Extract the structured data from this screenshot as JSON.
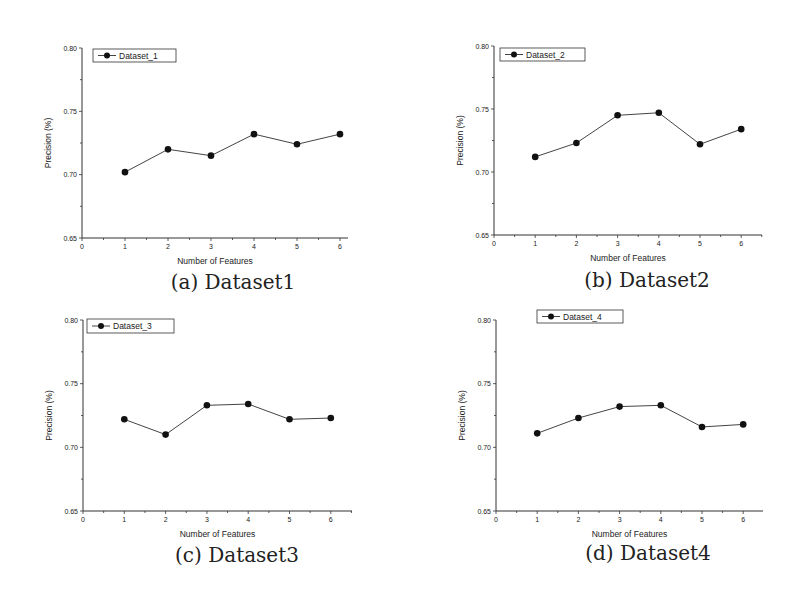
{
  "chart_data": [
    {
      "type": "line",
      "title": "Dataset_1",
      "caption": "(a) Dataset1",
      "xlabel": "Number of Features",
      "ylabel": "Precision (%)",
      "x": [
        1,
        2,
        3,
        4,
        5,
        6
      ],
      "series": [
        {
          "name": "Dataset_1",
          "values": [
            0.702,
            0.72,
            0.715,
            0.732,
            0.724,
            0.732
          ]
        }
      ],
      "xlim": [
        0,
        6.5
      ],
      "ylim": [
        0.65,
        0.8
      ],
      "xticks": [
        "0",
        "1",
        "2",
        "3",
        "4",
        "5",
        "6"
      ],
      "yticks": [
        "0.65",
        "0.70",
        "0.75",
        "0.80"
      ],
      "grid": false,
      "legend_position": "top-left"
    },
    {
      "type": "line",
      "title": "Dataset_2",
      "caption": "(b) Dataset2",
      "xlabel": "Number of Features",
      "ylabel": "Precision (%)",
      "x": [
        1,
        2,
        3,
        4,
        5,
        6
      ],
      "series": [
        {
          "name": "Dataset_2",
          "values": [
            0.712,
            0.723,
            0.745,
            0.747,
            0.722,
            0.734
          ]
        }
      ],
      "xlim": [
        0,
        6.5
      ],
      "ylim": [
        0.65,
        0.8
      ],
      "xticks": [
        "0",
        "1",
        "2",
        "3",
        "4",
        "5",
        "6"
      ],
      "yticks": [
        "0.65",
        "0.70",
        "0.75",
        "0.80"
      ],
      "grid": false,
      "legend_position": "top-left"
    },
    {
      "type": "line",
      "title": "Dataset_3",
      "caption": "(c) Dataset3",
      "xlabel": "Number of Features",
      "ylabel": "Precision (%)",
      "x": [
        1,
        2,
        3,
        4,
        5,
        6
      ],
      "series": [
        {
          "name": "Dataset_3",
          "values": [
            0.722,
            0.71,
            0.733,
            0.734,
            0.722,
            0.723
          ]
        }
      ],
      "xlim": [
        0,
        6.5
      ],
      "ylim": [
        0.65,
        0.8
      ],
      "xticks": [
        "0",
        "1",
        "2",
        "3",
        "4",
        "5",
        "6"
      ],
      "yticks": [
        "0.65",
        "0.70",
        "0.75",
        "0.80"
      ],
      "grid": false,
      "legend_position": "top-left"
    },
    {
      "type": "line",
      "title": "Dataset_4",
      "caption": "(d) Dataset4",
      "xlabel": "Number of Features",
      "ylabel": "Precision (%)",
      "x": [
        1,
        2,
        3,
        4,
        5,
        6
      ],
      "series": [
        {
          "name": "Dataset_4",
          "values": [
            0.711,
            0.723,
            0.732,
            0.733,
            0.716,
            0.718
          ]
        }
      ],
      "xlim": [
        0,
        6.5
      ],
      "ylim": [
        0.65,
        0.8
      ],
      "xticks": [
        "0",
        "1",
        "2",
        "3",
        "4",
        "5",
        "6"
      ],
      "yticks": [
        "0.65",
        "0.70",
        "0.75",
        "0.80"
      ],
      "grid": false,
      "legend_position": "top-center"
    }
  ],
  "style": {
    "line_color": "#444444",
    "marker_color": "#111111",
    "axis_color": "#333333"
  }
}
